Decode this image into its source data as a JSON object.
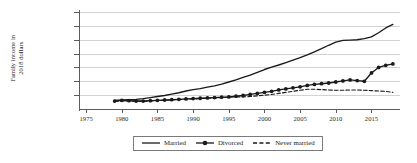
{
  "chart_data": {
    "type": "line",
    "title": "",
    "xlabel": "",
    "ylabel": "Family income in\n2018 dollars",
    "xlim": [
      1974,
      2019
    ],
    "ylim": [
      0,
      140000
    ],
    "grid": true,
    "legend_position": "bottom-center",
    "x_ticks": [
      "1975",
      "1980",
      "1985",
      "1990",
      "1995",
      "2000",
      "2005",
      "2010",
      "2015"
    ],
    "x_tick_values": [
      1975,
      1980,
      1985,
      1990,
      1995,
      2000,
      2005,
      2010,
      2015
    ],
    "y_ticks": [
      "$20,000",
      "$40,000",
      "$60,000",
      "$80,000",
      "$100,000",
      "$120,000",
      "$140,000"
    ],
    "y_tick_values": [
      20000,
      40000,
      60000,
      80000,
      100000,
      120000,
      140000
    ],
    "x": [
      1979,
      1980,
      1981,
      1982,
      1983,
      1984,
      1985,
      1986,
      1987,
      1988,
      1989,
      1990,
      1991,
      1992,
      1993,
      1994,
      1995,
      1996,
      1997,
      1998,
      1999,
      2000,
      2001,
      2002,
      2003,
      2004,
      2005,
      2006,
      2007,
      2008,
      2009,
      2010,
      2011,
      2012,
      2013,
      2014,
      2015,
      2016,
      2017,
      2018
    ],
    "series": [
      {
        "name": "Married",
        "style": "solid",
        "marker": "none",
        "color": "#1a1a1a",
        "values": [
          12500,
          13000,
          13500,
          14000,
          15000,
          16500,
          18000,
          19500,
          21500,
          23500,
          26000,
          28000,
          29500,
          31500,
          33500,
          36000,
          39000,
          42000,
          45500,
          49000,
          53000,
          57000,
          60500,
          63500,
          67000,
          70500,
          74000,
          78000,
          82500,
          87000,
          92000,
          96500,
          99000,
          99500,
          100000,
          101500,
          104000,
          110000,
          117000,
          122000
        ]
      },
      {
        "name": "Divorced",
        "style": "solid",
        "marker": "circle",
        "color": "#1a1a1a",
        "values": [
          11500,
          12500,
          12000,
          11500,
          11500,
          12000,
          12500,
          13000,
          13500,
          14000,
          14500,
          15000,
          15500,
          16000,
          16500,
          17000,
          17500,
          18500,
          19500,
          21000,
          22500,
          24000,
          25500,
          27500,
          29000,
          30500,
          32000,
          34000,
          35500,
          36500,
          37500,
          39000,
          40500,
          42000,
          41000,
          40000,
          52000,
          60000,
          63000,
          65000
        ]
      },
      {
        "name": "Never married",
        "style": "dashed",
        "marker": "none",
        "color": "#1a1a1a",
        "values": [
          11000,
          11500,
          11500,
          11000,
          11000,
          11500,
          12000,
          12500,
          13000,
          13500,
          14000,
          14500,
          15000,
          15500,
          16000,
          16500,
          17000,
          17500,
          17500,
          18000,
          19000,
          20000,
          21000,
          22500,
          24000,
          25500,
          27000,
          28500,
          28500,
          28000,
          27500,
          27000,
          27000,
          27500,
          27500,
          27000,
          26500,
          26000,
          25500,
          24000
        ]
      }
    ]
  },
  "legend": {
    "items": [
      {
        "label": "Married"
      },
      {
        "label": "Divorced"
      },
      {
        "label": "Never married"
      }
    ]
  }
}
